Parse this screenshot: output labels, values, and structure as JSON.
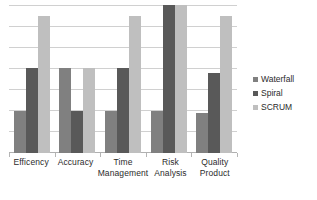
{
  "chart_data": {
    "type": "bar",
    "title": "",
    "subtitle": "",
    "xlabel": "",
    "ylabel": "",
    "grid": true,
    "legend_position": "right",
    "ylim": [
      0,
      7
    ],
    "y_tick_count": 8,
    "y_tick_labels": [],
    "categories": [
      "Efficency",
      "Accuracy",
      "Time Management",
      "Risk Analysis",
      "Quality Product"
    ],
    "series": [
      {
        "name": "Waterfall",
        "color": "#808080",
        "values": [
          2.0,
          4.0,
          2.0,
          2.0,
          1.9
        ]
      },
      {
        "name": "Spiral",
        "color": "#595959",
        "values": [
          4.0,
          2.0,
          4.0,
          7.0,
          3.8
        ]
      },
      {
        "name": "SCRUM",
        "color": "#bfbfbf",
        "values": [
          6.5,
          4.0,
          6.5,
          7.0,
          6.5
        ]
      }
    ]
  },
  "legend": {
    "items": [
      {
        "label": "Waterfall",
        "color": "#808080",
        "marker": "square-swatch-icon"
      },
      {
        "label": "Spiral",
        "color": "#595959",
        "marker": "square-swatch-icon"
      },
      {
        "label": "SCRUM",
        "color": "#bfbfbf",
        "marker": "square-swatch-icon"
      }
    ]
  },
  "axis": {
    "categories": [
      {
        "line1": "Efficency",
        "line2": ""
      },
      {
        "line1": "Accuracy",
        "line2": ""
      },
      {
        "line1": "Time",
        "line2": "Management"
      },
      {
        "line1": "Risk Analysis",
        "line2": ""
      },
      {
        "line1": "Quality",
        "line2": "Product"
      }
    ]
  },
  "colors": {
    "gridline": "#d0d0d0",
    "baseline": "#b0b0b0",
    "background": "#ffffff",
    "text": "#2b2b2b"
  }
}
